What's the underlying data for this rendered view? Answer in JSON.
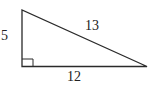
{
  "diagram": {
    "type": "right-triangle",
    "labels": {
      "vertical_leg": "5",
      "hypotenuse": "13",
      "horizontal_leg": "12"
    },
    "right_angle_marker": true,
    "stroke_color": "#2a2a2a"
  }
}
